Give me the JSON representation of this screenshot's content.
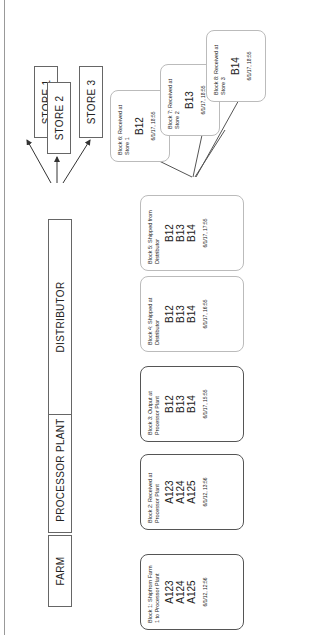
{
  "supply_chain": [
    {
      "id": "farm",
      "label": "FARM"
    },
    {
      "id": "processor",
      "label": "PROCESSOR PLANT"
    },
    {
      "id": "distributor",
      "label": "DISTRIBUTOR"
    },
    {
      "id": "store1",
      "label": "STORE 1"
    },
    {
      "id": "store2",
      "label": "STORE 2"
    },
    {
      "id": "store3",
      "label": "STORE 3"
    }
  ],
  "blocks": [
    {
      "title": "Block 1: Shipfrom Farm 1 to Processor Plant",
      "ids": [
        "A123",
        "A124",
        "A125"
      ],
      "timestamp": "6/1/12, 12:56"
    },
    {
      "title": "Block 2: Received at Processor Plant",
      "ids": [
        "A123",
        "A124",
        "A125"
      ],
      "timestamp": "6/1/12, 13:56"
    },
    {
      "title": "Block 3: Output at Processor Plant",
      "ids": [
        "B12",
        "B13",
        "B14"
      ],
      "timestamp": "6/1/17, 15:55"
    },
    {
      "title": "Block 4: Shipped at Distributor",
      "ids": [
        "B12",
        "B13",
        "B14"
      ],
      "timestamp": "6/1/17, 16:55"
    },
    {
      "title": "Block 5: Shipped from Distributor",
      "ids": [
        "B12",
        "B13",
        "B14"
      ],
      "timestamp": "6/1/17, 17:55"
    },
    {
      "title": "Block 6: Received at Store 1",
      "ids": [
        "B12"
      ],
      "timestamp": "6/1/17, 18:55"
    },
    {
      "title": "Block 7: Received at Store 2",
      "ids": [
        "B13"
      ],
      "timestamp": "6/1/17, 18:55"
    },
    {
      "title": "Block 8: Received at Store 3",
      "ids": [
        "B14"
      ],
      "timestamp": "6/1/17, 18:55"
    }
  ]
}
